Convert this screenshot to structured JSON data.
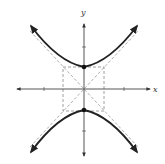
{
  "figure": {
    "type": "hyperbola",
    "equation_form": "y^2/a^2 - x^2/b^2 = 1",
    "axes": {
      "x_label": "x",
      "y_label": "y"
    },
    "colors": {
      "curve": "#222222",
      "axis": "#444444",
      "dashed": "#888888",
      "background": "#ffffff"
    },
    "vertices": [
      {
        "x": 0,
        "y": 1
      },
      {
        "x": 0,
        "y": -1
      }
    ],
    "fundamental_rectangle": {
      "x_min": -1,
      "x_max": 1,
      "y_min": -1,
      "y_max": 1
    },
    "asymptotes": [
      "y = x",
      "y = -x"
    ],
    "ticks": {
      "x": [
        -2,
        2
      ],
      "y": [
        -2,
        2
      ]
    }
  }
}
